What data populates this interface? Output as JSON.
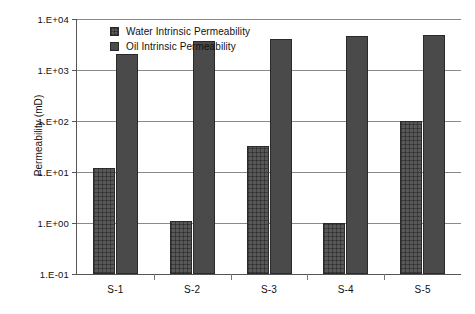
{
  "chart_data": {
    "type": "bar",
    "title": "",
    "xlabel": "",
    "ylabel": "Permeability (mD)",
    "categories": [
      "S-1",
      "S-2",
      "S-3",
      "S-4",
      "S-5"
    ],
    "yscale": "log",
    "ylim": [
      0.1,
      10000
    ],
    "ytick_labels": [
      "1.E+04",
      "1.E+03",
      "1.E+02",
      "1.E+01",
      "1.E+00",
      "1.E-01"
    ],
    "ytick_values": [
      10000,
      1000,
      100,
      10,
      1,
      0.1
    ],
    "grid": true,
    "legend_position": "top-left-inside",
    "series": [
      {
        "name": "Water Intrinsic Permeability",
        "color": "#585858",
        "pattern": "cross-hatch",
        "values": [
          12,
          1.1,
          33,
          1.0,
          100
        ]
      },
      {
        "name": "Oil Intrinsic Permeability",
        "color": "#4a4a4a",
        "pattern": "solid",
        "values": [
          2100,
          3700,
          4000,
          4600,
          4800
        ]
      }
    ]
  },
  "axis": {
    "y_title": "Permeability (mD)"
  }
}
